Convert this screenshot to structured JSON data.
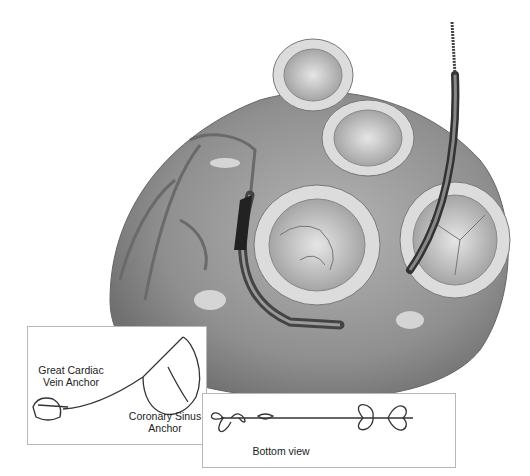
{
  "figure": {
    "insets": [
      {
        "id": "device-side-view",
        "labels": {
          "great_cardiac_vein_anchor": "Great Cardiac\nVein Anchor",
          "coronary_sinus_anchor": "Coronary Sinus\nAnchor"
        }
      },
      {
        "id": "device-bottom-view",
        "labels": {
          "bottom_view": "Bottom view"
        }
      }
    ],
    "colors": {
      "background": "#ffffff",
      "heart_tissue": "#9a9a9a",
      "valve_ring": "#d8d8d8",
      "line": "#333333"
    }
  }
}
